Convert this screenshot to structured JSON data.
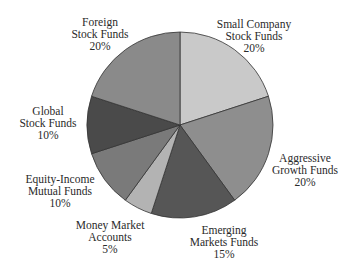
{
  "chart_data": {
    "type": "pie",
    "title": "",
    "start_angle_deg": 0,
    "direction": "clockwise",
    "center": [
      180,
      125
    ],
    "radius": 93,
    "slices": [
      {
        "label": "Small Company Stock Funds",
        "lines": [
          "Small Company",
          "Stock Funds"
        ],
        "value": 20,
        "pct_label": "20%",
        "color": "#c9c9c9",
        "label_pos": [
          254,
          18
        ]
      },
      {
        "label": "Aggressive Growth Funds",
        "lines": [
          "Aggressive",
          "Growth Funds"
        ],
        "value": 20,
        "pct_label": "20%",
        "color": "#8e8e8e",
        "label_pos": [
          305,
          152
        ]
      },
      {
        "label": "Emerging Markets Funds",
        "lines": [
          "Emerging",
          "Markets Funds"
        ],
        "value": 15,
        "pct_label": "15%",
        "color": "#565656",
        "label_pos": [
          224,
          224
        ]
      },
      {
        "label": "Money Market Accounts",
        "lines": [
          "Money Market",
          "Accounts"
        ],
        "value": 5,
        "pct_label": "5%",
        "color": "#b3b3b3",
        "label_pos": [
          110,
          219
        ]
      },
      {
        "label": "Equity-Income Mutual Funds",
        "lines": [
          "Equity-Income",
          "Mutual Funds"
        ],
        "value": 10,
        "pct_label": "10%",
        "color": "#7a7a7a",
        "label_pos": [
          60,
          173
        ]
      },
      {
        "label": "Global Stock Funds",
        "lines": [
          "Global",
          "Stock Funds"
        ],
        "value": 10,
        "pct_label": "10%",
        "color": "#4a4a4a",
        "label_pos": [
          48,
          105
        ]
      },
      {
        "label": "Foreign Stock Funds",
        "lines": [
          "Foreign",
          "Stock Funds"
        ],
        "value": 20,
        "pct_label": "20%",
        "color": "#8a8a8a",
        "label_pos": [
          100,
          16
        ]
      }
    ],
    "legend": "none (direct labels)",
    "stroke_color": "#333333"
  }
}
